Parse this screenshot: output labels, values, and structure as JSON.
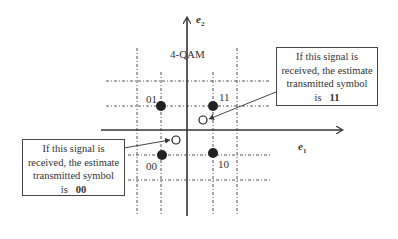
{
  "diagram": {
    "title": "4-QAM",
    "axes": {
      "horizontal": {
        "label": "e",
        "subscript": "1"
      },
      "vertical": {
        "label": "e",
        "subscript": "2"
      }
    },
    "constellation_points": [
      {
        "symbol": "01",
        "quadrant": "upper-left"
      },
      {
        "symbol": "11",
        "quadrant": "upper-right"
      },
      {
        "symbol": "00",
        "quadrant": "lower-left"
      },
      {
        "symbol": "10",
        "quadrant": "lower-right"
      }
    ],
    "received_signals": [
      {
        "annotation_line1": "If this signal is",
        "annotation_line2": "received, the estimate",
        "annotation_line3": "transmitted symbol",
        "annotation_prefix": "is",
        "estimated_symbol": "11"
      },
      {
        "annotation_line1": "If this signal is",
        "annotation_line2": "received, the estimate",
        "annotation_line3": "transmitted symbol",
        "annotation_prefix": "is",
        "estimated_symbol": "00"
      }
    ]
  }
}
